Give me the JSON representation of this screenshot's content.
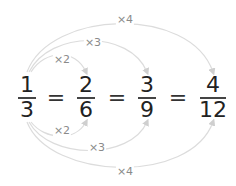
{
  "fractions": [
    {
      "numerator": "1",
      "denominator": "3"
    },
    {
      "numerator": "2",
      "denominator": "6"
    },
    {
      "numerator": "3",
      "denominator": "9"
    },
    {
      "numerator": "4",
      "denominator": "12"
    }
  ],
  "equals_sign": "=",
  "top_arcs": [
    {
      "label": "×2",
      "from": "1",
      "to": "2"
    },
    {
      "label": "×3",
      "from": "1",
      "to": "3"
    },
    {
      "label": "×4",
      "from": "1",
      "to": "4"
    }
  ],
  "bottom_arcs": [
    {
      "label": "×2",
      "from": "3",
      "to": "6"
    },
    {
      "label": "×3",
      "from": "3",
      "to": "9"
    },
    {
      "label": "×4",
      "from": "3",
      "to": "12"
    }
  ],
  "colors": {
    "arc": "#d8d8d8",
    "label": "#8a8a8a",
    "digits": "#222222"
  }
}
